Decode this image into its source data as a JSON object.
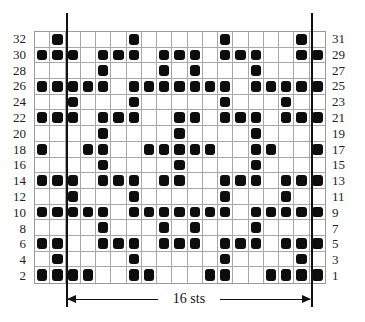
{
  "chart": {
    "columns": 19,
    "rows": 16,
    "left_labels": [
      "32",
      "30",
      "28",
      "26",
      "24",
      "22",
      "20",
      "18",
      "16",
      "14",
      "12",
      "10",
      "8",
      "6",
      "4",
      "2"
    ],
    "right_labels": [
      "31",
      "29",
      "27",
      "25",
      "23",
      "21",
      "19",
      "17",
      "15",
      "13",
      "11",
      "9",
      "7",
      "5",
      "3",
      "1"
    ],
    "filled_cells_by_row": [
      [
        2,
        7,
        13,
        18
      ],
      [
        1,
        2,
        3,
        5,
        6,
        7,
        9,
        10,
        11,
        13,
        14,
        15,
        18,
        19
      ],
      [
        5,
        9,
        11,
        15
      ],
      [
        1,
        2,
        3,
        4,
        5,
        7,
        8,
        9,
        10,
        11,
        12,
        13,
        15,
        16,
        17,
        18,
        19
      ],
      [
        3,
        7,
        13,
        17
      ],
      [
        1,
        2,
        3,
        5,
        6,
        7,
        10,
        11,
        13,
        14,
        15,
        17,
        18,
        19
      ],
      [
        5,
        10,
        15
      ],
      [
        1,
        4,
        5,
        8,
        9,
        10,
        11,
        12,
        15,
        16,
        19
      ],
      [
        5,
        10,
        15
      ],
      [
        1,
        2,
        3,
        5,
        6,
        7,
        9,
        10,
        13,
        14,
        15,
        17,
        18,
        19
      ],
      [
        3,
        7,
        13,
        17
      ],
      [
        1,
        2,
        3,
        4,
        5,
        7,
        8,
        9,
        10,
        11,
        12,
        13,
        15,
        16,
        17,
        18,
        19
      ],
      [
        5,
        9,
        11,
        15
      ],
      [
        1,
        2,
        5,
        6,
        7,
        9,
        10,
        11,
        13,
        14,
        15,
        17,
        18,
        19
      ],
      [
        2,
        7,
        13,
        18
      ],
      [
        1,
        2,
        3,
        4,
        7,
        8,
        12,
        13,
        16,
        17,
        18,
        19
      ]
    ],
    "repeat": {
      "label": "16 sts",
      "start_col": 3,
      "end_col": 18
    },
    "colors": {
      "filled": "#0d0d0d",
      "grid": "#a8a8a8",
      "background": "#ffffff"
    }
  }
}
